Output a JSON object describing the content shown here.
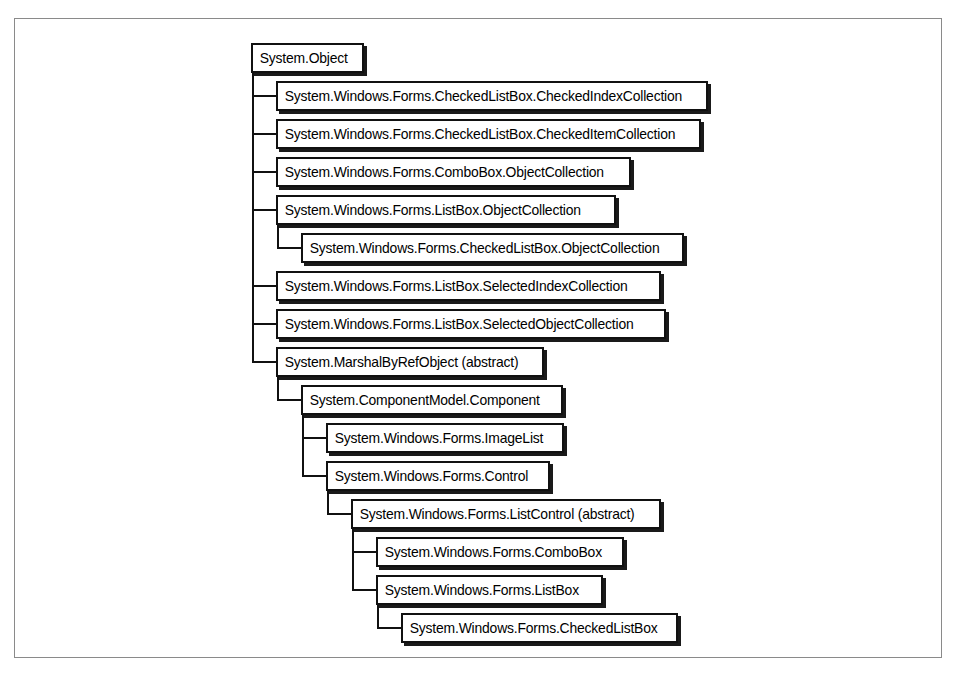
{
  "diagram": {
    "kind": "class-inheritance-hierarchy",
    "root_label": "System.Object",
    "colors": {
      "page_background": "#ffffff",
      "frame_border": "#8a8a8a",
      "node_border": "#111111",
      "node_fill": "#ffffff",
      "node_shadow": "#1a1a1a",
      "connector": "#111111",
      "text": "#000000"
    },
    "nodes": [
      {
        "id": "system-object",
        "label": "System.Object",
        "level": 0,
        "x": 236,
        "y": 24,
        "width": 113,
        "parent": null
      },
      {
        "id": "checkedlistbox-checkedindexcollection",
        "label": "System.Windows.Forms.CheckedListBox.CheckedIndexCollection",
        "level": 1,
        "x": 261,
        "y": 62,
        "width": 432,
        "parent": "system-object"
      },
      {
        "id": "checkedlistbox-checkeditemcollection",
        "label": "System.Windows.Forms.CheckedListBox.CheckedItemCollection",
        "level": 1,
        "x": 261,
        "y": 100,
        "width": 425,
        "parent": "system-object"
      },
      {
        "id": "combobox-objectcollection",
        "label": "System.Windows.Forms.ComboBox.ObjectCollection",
        "level": 1,
        "x": 261,
        "y": 138,
        "width": 355,
        "parent": "system-object"
      },
      {
        "id": "listbox-objectcollection",
        "label": "System.Windows.Forms.ListBox.ObjectCollection",
        "level": 1,
        "x": 261,
        "y": 176,
        "width": 340,
        "parent": "system-object"
      },
      {
        "id": "checkedlistbox-objectcollection",
        "label": "System.Windows.Forms.CheckedListBox.ObjectCollection",
        "level": 2,
        "x": 286,
        "y": 214,
        "width": 383,
        "parent": "listbox-objectcollection"
      },
      {
        "id": "listbox-selectedindexcollection",
        "label": "System.Windows.Forms.ListBox.SelectedIndexCollection",
        "level": 1,
        "x": 261,
        "y": 252,
        "width": 385,
        "parent": "system-object"
      },
      {
        "id": "listbox-selectedobjectcollection",
        "label": "System.Windows.Forms.ListBox.SelectedObjectCollection",
        "level": 1,
        "x": 261,
        "y": 290,
        "width": 390,
        "parent": "system-object"
      },
      {
        "id": "marshalbyrefobject",
        "label": "System.MarshalByRefObject (abstract)",
        "level": 1,
        "x": 261,
        "y": 328,
        "width": 268,
        "parent": "system-object"
      },
      {
        "id": "componentmodel-component",
        "label": "System.ComponentModel.Component",
        "level": 2,
        "x": 286,
        "y": 366,
        "width": 262,
        "parent": "marshalbyrefobject"
      },
      {
        "id": "imagelist",
        "label": "System.Windows.Forms.ImageList",
        "level": 3,
        "x": 311,
        "y": 404,
        "width": 238,
        "parent": "componentmodel-component"
      },
      {
        "id": "control",
        "label": "System.Windows.Forms.Control",
        "level": 3,
        "x": 311,
        "y": 442,
        "width": 224,
        "parent": "componentmodel-component"
      },
      {
        "id": "listcontrol",
        "label": "System.Windows.Forms.ListControl (abstract)",
        "level": 4,
        "x": 336,
        "y": 480,
        "width": 310,
        "parent": "control"
      },
      {
        "id": "combobox",
        "label": "System.Windows.Forms.ComboBox",
        "level": 5,
        "x": 361,
        "y": 518,
        "width": 248,
        "parent": "listcontrol"
      },
      {
        "id": "listbox",
        "label": "System.Windows.Forms.ListBox",
        "level": 5,
        "x": 361,
        "y": 556,
        "width": 227,
        "parent": "listcontrol"
      },
      {
        "id": "checkedlistbox",
        "label": "System.Windows.Forms.CheckedListBox",
        "level": 6,
        "x": 386,
        "y": 594,
        "width": 277,
        "parent": "listbox"
      }
    ]
  }
}
